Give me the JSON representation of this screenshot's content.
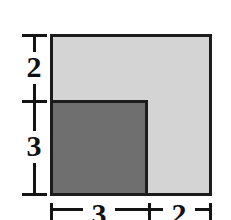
{
  "figure": {
    "background_color": "#ffffff",
    "line_color": "#141414"
  },
  "chart_data": {
    "type": "diagram",
    "title": "",
    "xlabel": "",
    "ylabel": "",
    "shapes": [
      {
        "name": "outer-square",
        "shade": "light-gray",
        "fill": "#d4d4d4",
        "stroke": "#1c1c1c",
        "width_units": 5,
        "height_units": 5
      },
      {
        "name": "inner-square",
        "shade": "dark-gray",
        "fill": "#6f6f6f",
        "stroke": "#1c1c1c",
        "width_units": 3,
        "height_units": 3
      }
    ],
    "dimensions": [
      {
        "id": "vertical-top",
        "orientation": "vertical",
        "label": "2",
        "position": "left",
        "segment": "upper"
      },
      {
        "id": "vertical-bottom",
        "orientation": "vertical",
        "label": "3",
        "position": "left",
        "segment": "lower"
      },
      {
        "id": "horizontal-left",
        "orientation": "horizontal",
        "label": "3",
        "position": "bottom",
        "segment": "left"
      },
      {
        "id": "horizontal-right",
        "orientation": "horizontal",
        "label": "2",
        "position": "bottom",
        "segment": "right"
      }
    ],
    "labels": {
      "vertical_top": "2",
      "vertical_bottom": "3",
      "horizontal_left": "3",
      "horizontal_right": "2"
    }
  }
}
